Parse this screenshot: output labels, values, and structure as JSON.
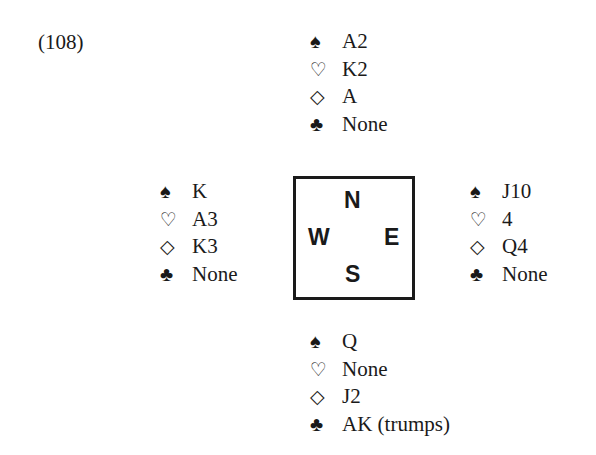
{
  "problem_number": "(108)",
  "suit_symbols": {
    "spades": "♠",
    "hearts": "♡",
    "diamonds": "◇",
    "clubs": "♣"
  },
  "compass": {
    "north": "N",
    "south": "S",
    "east": "E",
    "west": "W"
  },
  "hands": {
    "north": {
      "spades": "A2",
      "hearts": "K2",
      "diamonds": "A",
      "clubs": "None"
    },
    "west": {
      "spades": "K",
      "hearts": "A3",
      "diamonds": "K3",
      "clubs": "None"
    },
    "east": {
      "spades": "J10",
      "hearts": "4",
      "diamonds": "Q4",
      "clubs": "None"
    },
    "south": {
      "spades": "Q",
      "hearts": "None",
      "diamonds": "J2",
      "clubs": "AK (trumps)"
    }
  }
}
